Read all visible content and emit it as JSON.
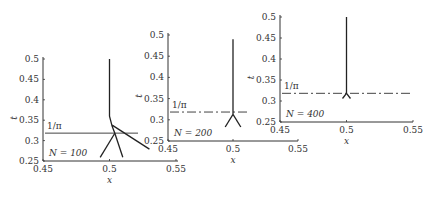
{
  "chart_data": [
    {
      "type": "line",
      "panel": "N = 100",
      "annotation_N": "N = 100",
      "annotation_line": "1/π",
      "xlabel": "x",
      "ylabel": "t",
      "xlim": [
        0.45,
        0.55
      ],
      "ylim": [
        0.25,
        0.5
      ],
      "xticks": [
        "0.45",
        "0.5",
        "0.55"
      ],
      "yticks": [
        "0.25",
        "0.3",
        "0.35",
        "0.4",
        "0.45",
        "0.5"
      ],
      "reference_line": {
        "y": 0.3183,
        "style": "solid"
      },
      "branches": [
        {
          "x": [
            0.5,
            0.5,
            0.502,
            0.504
          ],
          "y": [
            0.5,
            0.36,
            0.335,
            0.318
          ]
        },
        {
          "x": [
            0.504,
            0.493
          ],
          "y": [
            0.318,
            0.259
          ]
        },
        {
          "x": [
            0.504,
            0.51
          ],
          "y": [
            0.318,
            0.259
          ]
        },
        {
          "x": [
            0.502,
            0.53
          ],
          "y": [
            0.338,
            0.279
          ]
        }
      ]
    },
    {
      "type": "line",
      "panel": "N = 200",
      "annotation_N": "N = 200",
      "annotation_line": "1/π",
      "xlabel": "x",
      "ylabel": "t",
      "xlim": [
        0.45,
        0.55
      ],
      "ylim": [
        0.25,
        0.5
      ],
      "xticks": [
        "0.45",
        "0.5",
        "0.55"
      ],
      "yticks": [
        "0.25",
        "0.3",
        "0.35",
        "0.4",
        "0.45",
        "0.5"
      ],
      "reference_line": {
        "y": 0.3183,
        "style": "dash-dot"
      },
      "branches": [
        {
          "x": [
            0.5,
            0.5
          ],
          "y": [
            0.49,
            0.313
          ]
        },
        {
          "x": [
            0.5,
            0.494
          ],
          "y": [
            0.313,
            0.283
          ]
        },
        {
          "x": [
            0.5,
            0.506
          ],
          "y": [
            0.313,
            0.283
          ]
        }
      ]
    },
    {
      "type": "line",
      "panel": "N = 400",
      "annotation_N": "N = 400",
      "annotation_line": "1/π",
      "xlabel": "x",
      "ylabel": "t",
      "xlim": [
        0.45,
        0.55
      ],
      "ylim": [
        0.25,
        0.5
      ],
      "xticks": [
        "0.45",
        "0.5",
        "0.55"
      ],
      "yticks": [
        "0.25",
        "0.3",
        "0.35",
        "0.4",
        "0.45",
        "0.5"
      ],
      "reference_line": {
        "y": 0.3183,
        "style": "dash-dot"
      },
      "branches": [
        {
          "x": [
            0.5,
            0.5
          ],
          "y": [
            0.5,
            0.318
          ]
        },
        {
          "x": [
            0.5,
            0.497
          ],
          "y": [
            0.318,
            0.306
          ]
        },
        {
          "x": [
            0.5,
            0.503
          ],
          "y": [
            0.318,
            0.306
          ]
        }
      ]
    }
  ],
  "panels": [
    {
      "N_label": "N = 100",
      "pi_label": "1/π",
      "xlabel": "x",
      "ylabel": "t"
    },
    {
      "N_label": "N = 200",
      "pi_label": "1/π",
      "xlabel": "x",
      "ylabel": "t"
    },
    {
      "N_label": "N = 400",
      "pi_label": "1/π",
      "xlabel": "x",
      "ylabel": "t"
    }
  ]
}
